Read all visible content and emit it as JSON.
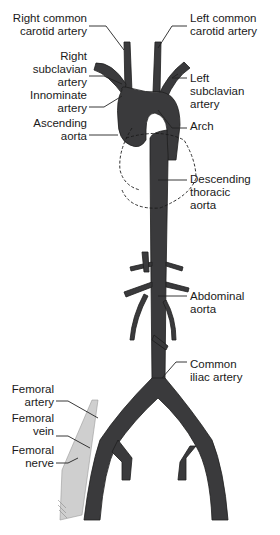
{
  "diagram": {
    "colors": {
      "vessel": "#3a3a3c",
      "vessel_outline": "#1e1e1e",
      "nerve": "#c8c8c8",
      "leader": "#222222",
      "background": "#ffffff"
    },
    "labels_left": [
      {
        "id": "right-common-carotid",
        "lines": [
          "Right common",
          "carotid artery"
        ]
      },
      {
        "id": "right-subclavian",
        "lines": [
          "Right",
          "subclavian",
          "artery"
        ]
      },
      {
        "id": "innominate",
        "lines": [
          "Innominate",
          "artery"
        ]
      },
      {
        "id": "ascending-aorta",
        "lines": [
          "Ascending",
          "aorta"
        ]
      },
      {
        "id": "femoral-artery",
        "lines": [
          "Femoral",
          "artery"
        ]
      },
      {
        "id": "femoral-vein",
        "lines": [
          "Femoral",
          "vein"
        ]
      },
      {
        "id": "femoral-nerve",
        "lines": [
          "Femoral",
          "nerve"
        ]
      }
    ],
    "labels_right": [
      {
        "id": "left-common-carotid",
        "lines": [
          "Left common",
          "carotid artery"
        ]
      },
      {
        "id": "left-subclavian",
        "lines": [
          "Left",
          "subclavian",
          "artery"
        ]
      },
      {
        "id": "arch",
        "lines": [
          "Arch"
        ]
      },
      {
        "id": "descending-thoracic",
        "lines": [
          "Descending",
          "thoracic",
          "aorta"
        ]
      },
      {
        "id": "abdominal-aorta",
        "lines": [
          "Abdominal",
          "aorta"
        ]
      },
      {
        "id": "common-iliac",
        "lines": [
          "Common",
          "iliac artery"
        ]
      }
    ]
  }
}
